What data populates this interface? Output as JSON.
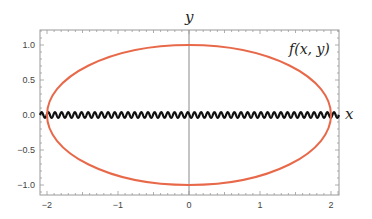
{
  "chart_data": {
    "type": "line",
    "title": "",
    "xlabel": "x",
    "ylabel": "y",
    "annotation": "f(x,y)",
    "xlim": [
      -2.1,
      2.1
    ],
    "ylim": [
      -1.2,
      1.2
    ],
    "grid": false,
    "frame": true,
    "x_ticks": [
      -2,
      -1,
      0,
      1,
      2
    ],
    "x_tick_labels": [
      "−2",
      "−1",
      "0",
      "1",
      "2"
    ],
    "y_ticks": [
      -1.0,
      -0.5,
      0.0,
      0.5,
      1.0
    ],
    "y_tick_labels": [
      "−1.0",
      "−0.5",
      "0.0",
      "0.5",
      "1.0"
    ],
    "series": [
      {
        "name": "ellipse",
        "kind": "parametric",
        "equation": "x^2/4 + y^2 = 1",
        "semi_axis_x": 2,
        "semi_axis_y": 1,
        "color": "#e8694a"
      },
      {
        "name": "oscillation",
        "kind": "function",
        "description": "rapid small-amplitude oscillation along y=0",
        "amplitude": 0.04,
        "cycles": 45,
        "color": "#111111"
      }
    ]
  },
  "labels": {
    "x_axis": "x",
    "y_axis": "y",
    "function": "f(x, y)"
  }
}
